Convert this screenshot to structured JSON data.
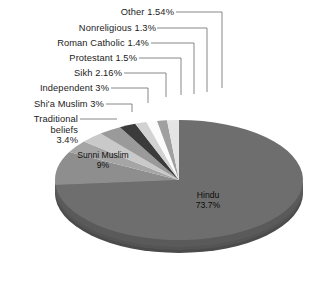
{
  "chart_data": {
    "type": "pie",
    "title": "",
    "subtitle": "",
    "xlabel": "",
    "ylabel": "",
    "legend_position": "none",
    "grid": false,
    "style": "3d-exploded-depth",
    "units": "percent",
    "categories": [
      "Hindu",
      "Sunni Muslim",
      "Traditional beliefs",
      "Shi'a Muslim",
      "Independent",
      "Sikh",
      "Protestant",
      "Roman Catholic",
      "Nonreligious",
      "Other"
    ],
    "values": [
      73.7,
      9,
      3.4,
      3,
      3,
      2.16,
      1.5,
      1.4,
      1.3,
      1.54
    ],
    "value_labels": [
      "73.7%",
      "9%",
      "3.4%",
      "3%",
      "3%",
      "2.16%",
      "1.5%",
      "1.4%",
      "1.3%",
      "1.54%"
    ],
    "slice_colors": [
      "#6e6e6e",
      "#8e8e8e",
      "#a5a5a5",
      "#c9c9c9",
      "#9a9a9a",
      "#3b3b3b",
      "#d2d2d2",
      "#fbfbfb",
      "#a0a0a0",
      "#e4e4e4"
    ],
    "slices": [
      {
        "name": "Hindu",
        "value": 73.7,
        "label": "Hindu",
        "value_label": "73.7%",
        "color": "#6e6e6e",
        "label_placement": "inside"
      },
      {
        "name": "Sunni Muslim",
        "value": 9,
        "label": "Sunni Muslim",
        "value_label": "9%",
        "color": "#8e8e8e",
        "label_placement": "inside"
      },
      {
        "name": "Traditional beliefs",
        "value": 3.4,
        "label": "Traditional beliefs",
        "value_label": "3.4%",
        "color": "#a5a5a5",
        "label_placement": "callout"
      },
      {
        "name": "Shi'a Muslim",
        "value": 3,
        "label": "Shi'a Muslim",
        "value_label": "3%",
        "color": "#c9c9c9",
        "label_placement": "callout"
      },
      {
        "name": "Independent",
        "value": 3,
        "label": "Independent",
        "value_label": "3%",
        "color": "#9a9a9a",
        "label_placement": "callout"
      },
      {
        "name": "Sikh",
        "value": 2.16,
        "label": "Sikh",
        "value_label": "2.16%",
        "color": "#3b3b3b",
        "label_placement": "callout"
      },
      {
        "name": "Protestant",
        "value": 1.5,
        "label": "Protestant",
        "value_label": "1.5%",
        "color": "#d2d2d2",
        "label_placement": "callout"
      },
      {
        "name": "Roman Catholic",
        "value": 1.4,
        "label": "Roman Catholic",
        "value_label": "1.4%",
        "color": "#fbfbfb",
        "label_placement": "callout"
      },
      {
        "name": "Nonreligious",
        "value": 1.3,
        "label": "Nonreligious",
        "value_label": "1.3%",
        "color": "#a0a0a0",
        "label_placement": "callout"
      },
      {
        "name": "Other",
        "value": 1.54,
        "label": "Other",
        "value_label": "1.54%",
        "color": "#e4e4e4",
        "label_placement": "callout"
      }
    ]
  },
  "callouts": {
    "other": "Other 1.54%",
    "nonreligious": "Nonreligious 1.3%",
    "roman_catholic": "Roman Catholic 1.4%",
    "protestant": "Protestant 1.5%",
    "sikh": "Sikh 2.16%",
    "independent": "Independent 3%",
    "shia_muslim": "Shi'a Muslim 3%",
    "traditional_line1": "Traditional",
    "traditional_line2": "beliefs",
    "traditional_line3": "3.4%"
  },
  "inner_labels": {
    "sunni_name": "Sunni Muslim",
    "sunni_value": "9%",
    "hindu_name": "Hindu",
    "hindu_value": "73.7%"
  },
  "colors": {
    "background": "#ffffff",
    "text": "#1b1b1b",
    "leader_line": "#6b6b6b",
    "pie_depth_dark": "#4f4f4f",
    "pie_depth_mid": "#5c5c5c"
  }
}
